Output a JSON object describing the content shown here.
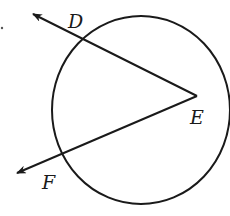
{
  "diagram": {
    "type": "circle-with-angle",
    "stroke_color": "#1a1a1a",
    "background": "#ffffff",
    "circle": {
      "cx": 141,
      "cy": 110,
      "rx": 89,
      "ry": 94
    },
    "vertex": {
      "name": "E",
      "x": 197,
      "y": 96,
      "label": "E",
      "label_x": 190,
      "label_y": 124
    },
    "rays": [
      {
        "name": "ED",
        "from": [
          197,
          96
        ],
        "to": [
          33,
          14
        ],
        "label": "D",
        "label_x": 68,
        "label_y": 28,
        "crosses_circle_at": [
          82,
          40
        ]
      },
      {
        "name": "EF",
        "from": [
          197,
          96
        ],
        "to": [
          17,
          173
        ],
        "label": "F",
        "label_x": 42,
        "label_y": 189,
        "crosses_circle_at": [
          63,
          154
        ]
      }
    ],
    "labels": {
      "D": "D",
      "E": "E",
      "F": "F"
    }
  }
}
